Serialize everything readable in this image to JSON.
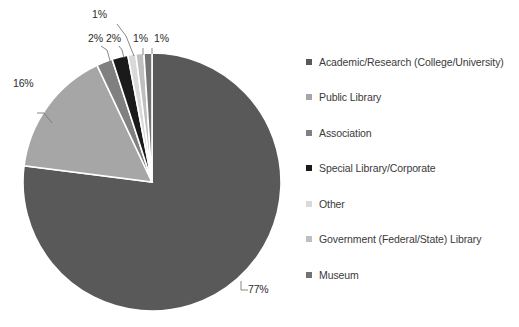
{
  "chart_data": {
    "type": "pie",
    "title": "",
    "legend_position": "right",
    "categories": [
      "Academic/Research (College/University)",
      "Public Library",
      "Association",
      "Special Library/Corporate",
      "Other",
      "Government (Federal/State) Library",
      "Museum"
    ],
    "values": [
      77,
      16,
      2,
      2,
      1,
      1,
      1
    ],
    "value_labels": [
      "77%",
      "16%",
      "2%",
      "2%",
      "1%",
      "1%",
      "1%"
    ],
    "colors": [
      "#595959",
      "#a6a6a6",
      "#808080",
      "#1a1a1a",
      "#d9d9d9",
      "#bfbfbf",
      "#737373"
    ],
    "slice_border_color": "#ffffff",
    "units": "percent"
  },
  "pie": {
    "labels": [
      {
        "text": "77%",
        "name": "pct-label-academic"
      },
      {
        "text": "16%",
        "name": "pct-label-public-library"
      },
      {
        "text": "2%",
        "name": "pct-label-association"
      },
      {
        "text": "2%",
        "name": "pct-label-special-library"
      },
      {
        "text": "1%",
        "name": "pct-label-other"
      },
      {
        "text": "1%",
        "name": "pct-label-government"
      },
      {
        "text": "1%",
        "name": "pct-label-museum"
      }
    ]
  },
  "legend": {
    "items": [
      {
        "label": "Academic/Research (College/University)",
        "color": "#595959"
      },
      {
        "label": "Public Library",
        "color": "#a6a6a6"
      },
      {
        "label": "Association",
        "color": "#808080"
      },
      {
        "label": "Special Library/Corporate",
        "color": "#1a1a1a"
      },
      {
        "label": "Other",
        "color": "#d9d9d9"
      },
      {
        "label": "Government (Federal/State) Library",
        "color": "#bfbfbf"
      },
      {
        "label": "Museum",
        "color": "#737373"
      }
    ]
  }
}
